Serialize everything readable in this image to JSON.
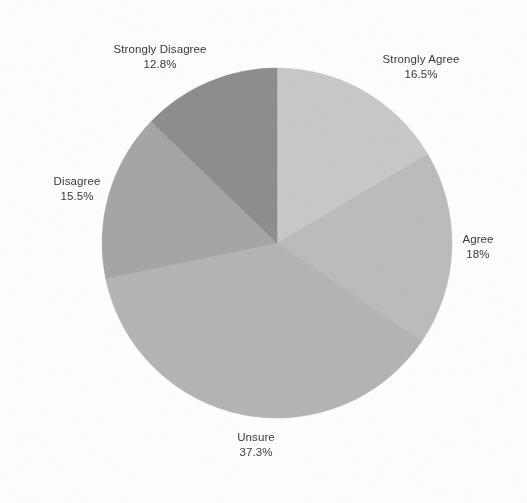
{
  "chart_data": {
    "type": "pie",
    "title": "",
    "subtitle": "",
    "xlabel": "",
    "ylabel": "",
    "legend_position": "none",
    "grid": false,
    "label_format": "name on first line, percentage on second line, placed outside each slice",
    "start_angle_deg": 90,
    "direction": "clockwise",
    "categories": [
      "Strongly Agree",
      "Agree",
      "Unsure",
      "Disagree",
      "Strongly Disagree"
    ],
    "values": [
      16.5,
      18.0,
      37.3,
      15.5,
      12.8
    ],
    "value_labels": [
      "16.5%",
      "18%",
      "37.3%",
      "15.5%",
      "12.8%"
    ],
    "colors": [
      "#c9c9c9",
      "#bcbcbc",
      "#b5b5b5",
      "#a6a6a6",
      "#8e8e8e"
    ],
    "slices": [
      {
        "name": "Strongly Agree",
        "value": 16.5,
        "value_label": "16.5%",
        "color": "#c9c9c9"
      },
      {
        "name": "Agree",
        "value": 18.0,
        "value_label": "18%",
        "color": "#bcbcbc"
      },
      {
        "name": "Unsure",
        "value": 37.3,
        "value_label": "37.3%",
        "color": "#b5b5b5"
      },
      {
        "name": "Disagree",
        "value": 15.5,
        "value_label": "15.5%",
        "color": "#a6a6a6"
      },
      {
        "name": "Strongly Disagree",
        "value": 12.8,
        "value_label": "12.8%",
        "color": "#8e8e8e"
      }
    ]
  },
  "labels": {
    "strongly_agree": {
      "name": "Strongly Agree",
      "value": "16.5%"
    },
    "agree": {
      "name": "Agree",
      "value": "18%"
    },
    "unsure": {
      "name": "Unsure",
      "value": "37.3%"
    },
    "disagree": {
      "name": "Disagree",
      "value": "15.5%"
    },
    "strongly_disagree": {
      "name": "Strongly Disagree",
      "value": "12.8%"
    }
  },
  "geometry": {
    "center_x": 277,
    "center_y": 243,
    "radius": 175
  },
  "colors": {
    "background": "#ffffff",
    "text": "#3a3a3a"
  }
}
